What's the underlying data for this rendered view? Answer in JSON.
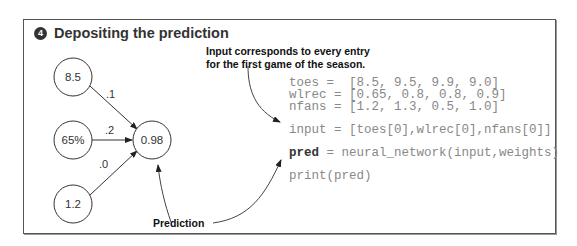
{
  "title": {
    "step_number": "4",
    "text": "Depositing the prediction"
  },
  "network": {
    "inputs": [
      {
        "value": "8.5",
        "weight": ".1"
      },
      {
        "value": "65%",
        "weight": ".2"
      },
      {
        "value": "1.2",
        "weight": ".0"
      }
    ],
    "output": {
      "value": "0.98"
    }
  },
  "annotations": {
    "input_note_line1": "Input corresponds to every entry",
    "input_note_line2": "for the first game of the season.",
    "prediction_label": "Prediction"
  },
  "code": {
    "line1": "toes =  [8.5, 9.5, 9.9, 9.0]",
    "line2": "wlrec = [0.65, 0.8, 0.8, 0.9]",
    "line3": "nfans = [1.2, 1.3, 0.5, 1.0]",
    "line4": "input = [toes[0],wlrec[0],nfans[0]]",
    "line5_keyword": "pred",
    "line5_rest": " = neural_network(input,weights)",
    "line6": "print(pred)"
  }
}
